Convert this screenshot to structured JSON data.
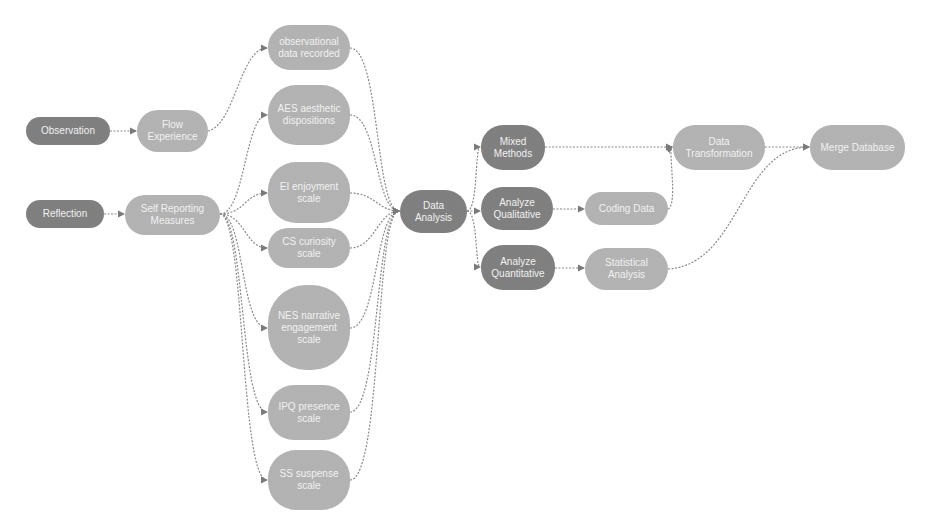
{
  "diagram": {
    "nodes": {
      "observation": {
        "label": "Observation",
        "shade": "dark"
      },
      "flow_experience": {
        "label": "Flow Experience",
        "shade": "light"
      },
      "reflection": {
        "label": "Reflection",
        "shade": "dark"
      },
      "self_reporting": {
        "label": "Self Reporting Measures",
        "shade": "light"
      },
      "observational_data": {
        "label": "observational data recorded",
        "shade": "light"
      },
      "aes": {
        "label": "AES aesthetic dispositions",
        "shade": "light"
      },
      "ei": {
        "label": "EI enjoyment scale",
        "shade": "light"
      },
      "cs": {
        "label": "CS curiosity scale",
        "shade": "light"
      },
      "nes": {
        "label": "NES narrative engagement scale",
        "shade": "light"
      },
      "ipq": {
        "label": "IPQ presence scale",
        "shade": "light"
      },
      "ss": {
        "label": "SS suspense scale",
        "shade": "light"
      },
      "data_analysis": {
        "label": "Data Analysis",
        "shade": "dark"
      },
      "mixed_methods": {
        "label": "Mixed Methods",
        "shade": "dark"
      },
      "analyze_qualitative": {
        "label": "Analyze Qualitative",
        "shade": "dark"
      },
      "analyze_quantitative": {
        "label": "Analyze Quantitative",
        "shade": "dark"
      },
      "coding_data": {
        "label": "Coding Data",
        "shade": "light"
      },
      "statistical_analysis": {
        "label": "Statistical Analysis",
        "shade": "light"
      },
      "data_transformation": {
        "label": "Data Transformation",
        "shade": "light"
      },
      "merge_database": {
        "label": "Merge Database",
        "shade": "light"
      }
    },
    "edges": [
      [
        "observation",
        "flow_experience"
      ],
      [
        "reflection",
        "self_reporting"
      ],
      [
        "flow_experience",
        "observational_data"
      ],
      [
        "self_reporting",
        "aes"
      ],
      [
        "self_reporting",
        "ei"
      ],
      [
        "self_reporting",
        "cs"
      ],
      [
        "self_reporting",
        "nes"
      ],
      [
        "self_reporting",
        "ipq"
      ],
      [
        "self_reporting",
        "ss"
      ],
      [
        "observational_data",
        "data_analysis"
      ],
      [
        "aes",
        "data_analysis"
      ],
      [
        "ei",
        "data_analysis"
      ],
      [
        "cs",
        "data_analysis"
      ],
      [
        "nes",
        "data_analysis"
      ],
      [
        "ipq",
        "data_analysis"
      ],
      [
        "ss",
        "data_analysis"
      ],
      [
        "data_analysis",
        "mixed_methods"
      ],
      [
        "data_analysis",
        "analyze_qualitative"
      ],
      [
        "data_analysis",
        "analyze_quantitative"
      ],
      [
        "analyze_qualitative",
        "coding_data"
      ],
      [
        "analyze_quantitative",
        "statistical_analysis"
      ],
      [
        "mixed_methods",
        "data_transformation"
      ],
      [
        "coding_data",
        "data_transformation"
      ],
      [
        "data_transformation",
        "merge_database"
      ],
      [
        "statistical_analysis",
        "merge_database"
      ]
    ],
    "colors": {
      "dark": "#6f6f6f",
      "light": "#a9a9a9",
      "edge": "#8a8a8a",
      "text": "#f1f1f1"
    }
  }
}
